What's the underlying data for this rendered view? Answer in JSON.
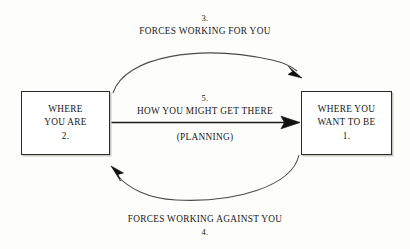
{
  "diagram": {
    "background_color": "#fdfdfb",
    "ink_color": "#1a1a1a",
    "nodes": [
      {
        "id": "current-state",
        "lines": [
          "WHERE",
          "YOU ARE",
          "2."
        ]
      },
      {
        "id": "goal-state",
        "lines": [
          "WHERE YOU",
          "WANT TO BE",
          "1."
        ]
      }
    ],
    "edges": [
      {
        "id": "forces-for",
        "number": "3.",
        "text": "FORCES WORKING FOR YOU",
        "direction": "left-to-right",
        "shape": "curve-above"
      },
      {
        "id": "how-to-get-there",
        "number": "5.",
        "text": "HOW YOU MIGHT GET THERE",
        "subtext": "(PLANNING)",
        "direction": "left-to-right",
        "shape": "straight"
      },
      {
        "id": "forces-against",
        "number": "4.",
        "text": "FORCES WORKING AGAINST YOU",
        "direction": "right-to-left",
        "shape": "curve-below"
      }
    ]
  }
}
